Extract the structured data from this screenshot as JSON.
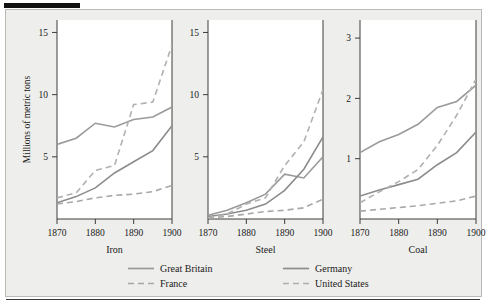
{
  "figure": {
    "y_axis_title": "Millions of metric tons",
    "panel_titles": [
      "Iron",
      "Steel",
      "Coal"
    ],
    "x_tick_labels": [
      "1870",
      "1880",
      "1890",
      "1900"
    ],
    "y_ticks_iron": [
      "15",
      "10",
      "5"
    ],
    "y_ticks_steel": [
      "15",
      "10",
      "5"
    ],
    "y_ticks_coal": [
      "3",
      "2",
      "1"
    ],
    "caption": "",
    "colors": {
      "great_britain": "#9a9a9a",
      "france": "#a8a8a8",
      "germany": "#8c8c8c",
      "united_states": "#b0b0b0",
      "axis": "#3c3c3c",
      "plate_background": "#eeeeec",
      "panel_background": "#ffffff",
      "rule": "#111111"
    }
  },
  "legend": {
    "position": "bottom",
    "entries": [
      {
        "label": "Great Britain",
        "dash": "solid",
        "color": "#9a9a9a"
      },
      {
        "label": "Germany",
        "dash": "solid",
        "color": "#8c8c8c"
      },
      {
        "label": "France",
        "dash": "dashed",
        "color": "#a8a8a8"
      },
      {
        "label": "United States",
        "dash": "dashed",
        "color": "#b0b0b0"
      }
    ]
  },
  "chart_data": [
    {
      "type": "line",
      "title": "Iron",
      "xlabel": "",
      "ylabel": "Millions of metric tons",
      "x": [
        1870,
        1875,
        1880,
        1885,
        1890,
        1895,
        1900
      ],
      "xlim": [
        1870,
        1900
      ],
      "ylim": [
        0,
        16
      ],
      "yticks": [
        5,
        10,
        15
      ],
      "xticks": [
        1870,
        1880,
        1890,
        1900
      ],
      "grid": false,
      "series": [
        {
          "name": "Great Britain",
          "dash": "solid",
          "values": [
            6.0,
            6.5,
            7.7,
            7.4,
            8.0,
            8.2,
            9.0
          ]
        },
        {
          "name": "France",
          "dash": "dashed",
          "values": [
            1.2,
            1.4,
            1.7,
            1.9,
            2.0,
            2.2,
            2.7
          ]
        },
        {
          "name": "Germany",
          "dash": "solid",
          "values": [
            1.3,
            1.8,
            2.5,
            3.7,
            4.6,
            5.5,
            7.5
          ]
        },
        {
          "name": "United States",
          "dash": "dashed",
          "values": [
            1.7,
            2.1,
            3.9,
            4.3,
            9.2,
            9.4,
            14.0
          ]
        }
      ]
    },
    {
      "type": "line",
      "title": "Steel",
      "xlabel": "",
      "ylabel": "",
      "x": [
        1870,
        1875,
        1880,
        1885,
        1890,
        1895,
        1900
      ],
      "xlim": [
        1870,
        1900
      ],
      "ylim": [
        0,
        16
      ],
      "yticks": [
        5,
        10,
        15
      ],
      "xticks": [
        1870,
        1880,
        1890,
        1900
      ],
      "grid": false,
      "series": [
        {
          "name": "Great Britain",
          "dash": "solid",
          "values": [
            0.3,
            0.7,
            1.3,
            2.0,
            3.6,
            3.3,
            5.0
          ]
        },
        {
          "name": "France",
          "dash": "dashed",
          "values": [
            0.1,
            0.2,
            0.4,
            0.6,
            0.7,
            0.9,
            1.6
          ]
        },
        {
          "name": "Germany",
          "dash": "solid",
          "values": [
            0.2,
            0.4,
            0.7,
            1.2,
            2.3,
            4.0,
            6.6
          ]
        },
        {
          "name": "United States",
          "dash": "dashed",
          "values": [
            0.1,
            0.4,
            1.2,
            1.7,
            4.3,
            6.2,
            10.4
          ]
        }
      ]
    },
    {
      "type": "line",
      "title": "Coal",
      "xlabel": "",
      "ylabel": "",
      "x": [
        1870,
        1875,
        1880,
        1885,
        1890,
        1895,
        1900
      ],
      "xlim": [
        1870,
        1900
      ],
      "ylim": [
        0,
        3.3
      ],
      "yticks": [
        1,
        2,
        3
      ],
      "xticks": [
        1870,
        1880,
        1890,
        1900
      ],
      "grid": false,
      "series": [
        {
          "name": "Great Britain",
          "dash": "solid",
          "values": [
            1.1,
            1.28,
            1.4,
            1.57,
            1.85,
            1.95,
            2.22
          ]
        },
        {
          "name": "France",
          "dash": "dashed",
          "values": [
            0.13,
            0.16,
            0.19,
            0.22,
            0.26,
            0.3,
            0.38
          ]
        },
        {
          "name": "Germany",
          "dash": "solid",
          "values": [
            0.38,
            0.48,
            0.57,
            0.66,
            0.9,
            1.1,
            1.44
          ]
        },
        {
          "name": "United States",
          "dash": "dashed",
          "values": [
            0.27,
            0.45,
            0.62,
            0.82,
            1.22,
            1.72,
            2.32
          ]
        }
      ]
    }
  ]
}
